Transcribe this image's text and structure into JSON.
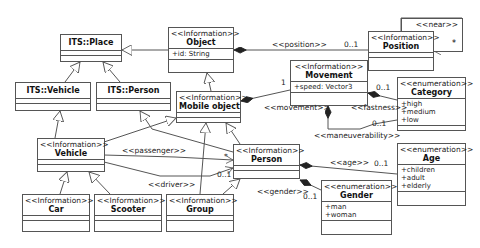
{
  "diagram": {
    "type": "UML class diagram",
    "classes": {
      "its_place": {
        "stereotype": "",
        "name": "ITS::Place",
        "attributes": []
      },
      "its_vehicle": {
        "stereotype": "",
        "name": "ITS::Vehicle",
        "attributes": []
      },
      "its_person": {
        "stereotype": "",
        "name": "ITS::Person",
        "attributes": []
      },
      "object": {
        "stereotype": "<<Information>>",
        "name": "Object",
        "attributes": [
          "+id: String"
        ]
      },
      "position": {
        "stereotype": "<<Information>>",
        "name": "Position",
        "attributes": []
      },
      "movement": {
        "stereotype": "<<Information>>",
        "name": "Movement",
        "attributes": [
          "+speed: Vector3"
        ]
      },
      "category": {
        "stereotype": "<<enumeration>>",
        "name": "Category",
        "attributes": [
          "+high",
          "+medium",
          "+low"
        ]
      },
      "mobile_object": {
        "stereotype": "<<Information>>",
        "name": "Mobile object",
        "attributes": []
      },
      "vehicle": {
        "stereotype": "<<Information>>",
        "name": "Vehicle",
        "attributes": []
      },
      "person": {
        "stereotype": "<<Information>>",
        "name": "Person",
        "attributes": []
      },
      "age": {
        "stereotype": "<<enumeration>>",
        "name": "Age",
        "attributes": [
          "+children",
          "+adult",
          "+elderly"
        ]
      },
      "gender": {
        "stereotype": "<<enumeration>>",
        "name": "Gender",
        "attributes": [
          "+man",
          "+woman"
        ]
      },
      "car": {
        "stereotype": "<<Information>>",
        "name": "Car",
        "attributes": []
      },
      "scooter": {
        "stereotype": "<<Information>>",
        "name": "Scooter",
        "attributes": []
      },
      "group": {
        "stereotype": "<<Information>>",
        "name": "Group",
        "attributes": []
      }
    },
    "self_association": {
      "stereotype": "<<near>>",
      "multiplicity": "*"
    },
    "labels": {
      "position": "<<position>>",
      "position_mult": "0..1",
      "movement": "<<movement>>",
      "movement_mult": "1",
      "fastness": "<<fastness>>",
      "fastness_mult": "0..1",
      "maneuverability": "<<maneuverability>>",
      "maneuverability_mult": "0..1",
      "passenger": "<<passenger>>",
      "passenger_mult": "*",
      "driver": "<<driver>>",
      "driver_mult": "0..1",
      "age": "<<age>>",
      "age_mult": "0..1",
      "gender": "<<gender>>",
      "gender_mult": "0..1"
    }
  }
}
